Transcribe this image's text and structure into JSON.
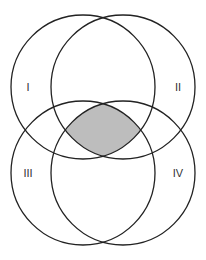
{
  "diagram": {
    "type": "venn",
    "fill_color": "#bdbdbd",
    "stroke_color": "#222222",
    "circles": [
      {
        "id": "I",
        "label": "I",
        "cx": 83,
        "cy": 87,
        "r": 72,
        "label_x": 28,
        "label_y": 88
      },
      {
        "id": "II",
        "label": "II",
        "cx": 123,
        "cy": 87,
        "r": 72,
        "label_x": 178,
        "label_y": 88
      },
      {
        "id": "III",
        "label": "III",
        "cx": 83,
        "cy": 173,
        "r": 72,
        "label_x": 28,
        "label_y": 174
      },
      {
        "id": "IV",
        "label": "IV",
        "cx": 123,
        "cy": 173,
        "r": 72,
        "label_x": 178,
        "label_y": 174
      }
    ],
    "shaded_region": "I ∩ II ∩ III ∩ IV"
  }
}
